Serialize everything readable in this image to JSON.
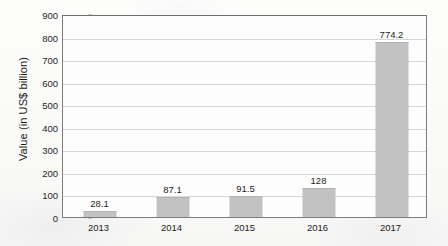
{
  "chart_data": {
    "type": "bar",
    "title": "",
    "xlabel": "",
    "ylabel": "Value (in US$ billion)",
    "categories": [
      "2013",
      "2014",
      "2015",
      "2016",
      "2017"
    ],
    "values": [
      28.1,
      87.1,
      91.5,
      128,
      774.2
    ],
    "value_labels": [
      "28.1",
      "87.1",
      "91.5",
      "128",
      "774.2"
    ],
    "ylim": [
      0,
      900
    ],
    "ytick_step": 100,
    "ytick_labels": [
      "900",
      "800",
      "700",
      "600",
      "500",
      "400",
      "300",
      "200",
      "100",
      "0"
    ],
    "ytick_values": [
      900,
      800,
      700,
      600,
      500,
      400,
      300,
      200,
      100,
      0
    ],
    "grid": true,
    "legend": false,
    "legend_position": "none",
    "bar_color": "#c2c2c2",
    "gridline_color": "#d5d7d9",
    "axis_color": "#7c7c7c",
    "text_color": "#1d1d1b",
    "background_color": "#fbfbfa"
  }
}
